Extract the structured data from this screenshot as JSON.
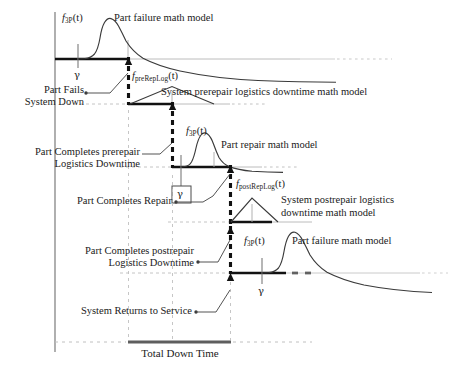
{
  "diagram": {
    "colors": {
      "ink": "#1a1a1a",
      "curve": "#2b2b2b",
      "axis": "#555555",
      "grid": "#9a9a9a",
      "thick_baseline": "#111111",
      "tdt_bar": "#5a5a5a"
    },
    "functions": [
      {
        "id": "f3p-top",
        "name": "f",
        "sub": "3P",
        "arg": "(t)"
      },
      {
        "id": "f-prerep",
        "name": "f",
        "sub": "preRepLog",
        "arg": "(t)"
      },
      {
        "id": "f3p-repair",
        "name": "f",
        "sub": "3P",
        "arg": "(t)"
      },
      {
        "id": "f-postrep",
        "name": "f",
        "sub": "postRepLog",
        "arg": "(t)"
      },
      {
        "id": "f3p-bottom",
        "name": "f",
        "sub": "3P",
        "arg": "(t)"
      }
    ],
    "model_labels": [
      {
        "id": "part-failure-top",
        "text": "Part failure math model"
      },
      {
        "id": "prerepair-logistics",
        "text": "System prerepair logistics downtime math model"
      },
      {
        "id": "part-repair",
        "text": "Part repair math model"
      },
      {
        "id": "postrepair-logistics-line1",
        "text": "System postrepair logistics"
      },
      {
        "id": "postrepair-logistics-line2",
        "text": "downtime math model"
      },
      {
        "id": "part-failure-bottom",
        "text": "Part failure math model"
      }
    ],
    "event_labels": [
      {
        "id": "part-fails",
        "line1": "Part Fails",
        "line2": "System Down"
      },
      {
        "id": "completes-prerepair",
        "line1": "Part Completes prerepair",
        "line2": "Logistics Downtime"
      },
      {
        "id": "completes-repair",
        "line1": "Part Completes Repair",
        "line2": ""
      },
      {
        "id": "completes-postrepair",
        "line1": "Part Completes postrepair",
        "line2": "Logistics Downtime"
      },
      {
        "id": "returns-to-service",
        "line1": "System Returns to Service",
        "line2": ""
      }
    ],
    "gamma_ticks": [
      {
        "id": "gamma-top",
        "symbol": "γ"
      },
      {
        "id": "gamma-boxed",
        "symbol": "γ"
      },
      {
        "id": "gamma-bottom",
        "symbol": "γ"
      }
    ],
    "total_down_time_label": "Total Down Time"
  }
}
